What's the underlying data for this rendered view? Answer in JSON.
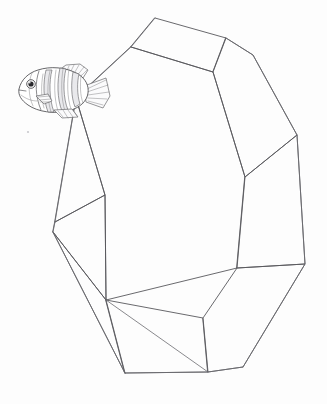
{
  "artwork": {
    "title": "Fish and faceted polyhedron line drawing",
    "medium": "pencil line drawing on white paper",
    "background_color": "#fdfdfd",
    "line_color": "#58585c",
    "canvas": {
      "width": 327,
      "height": 404
    }
  },
  "subjects": {
    "polyhedron": {
      "name": "faceted polyhedron",
      "description": "large irregular multi-faceted solid resembling a cut gem or rock, occupying most of the frame",
      "line_color": "#58585c",
      "fill_color": "#ffffff",
      "face_count": 8,
      "vertices": [
        {
          "id": "v-top-left",
          "x": 155,
          "y": 18
        },
        {
          "id": "v-top-right",
          "x": 226,
          "y": 38
        },
        {
          "id": "v-upper-left",
          "x": 131,
          "y": 47
        },
        {
          "id": "v-upper-mid",
          "x": 213,
          "y": 72
        },
        {
          "id": "v-right-upper",
          "x": 253,
          "y": 55
        },
        {
          "id": "v-right-mid",
          "x": 297,
          "y": 135
        },
        {
          "id": "v-left-shoulder",
          "x": 76,
          "y": 98
        },
        {
          "id": "v-left-mid",
          "x": 105,
          "y": 195
        },
        {
          "id": "v-center-right",
          "x": 245,
          "y": 177
        },
        {
          "id": "v-left-far",
          "x": 55,
          "y": 222
        },
        {
          "id": "v-right-lower",
          "x": 305,
          "y": 264
        },
        {
          "id": "v-left-low",
          "x": 53,
          "y": 232
        },
        {
          "id": "v-mid-low-left",
          "x": 106,
          "y": 300
        },
        {
          "id": "v-mid-low-center",
          "x": 203,
          "y": 318
        },
        {
          "id": "v-right-low",
          "x": 237,
          "y": 268
        },
        {
          "id": "v-bottom-left",
          "x": 125,
          "y": 373
        },
        {
          "id": "v-bottom-mid",
          "x": 208,
          "y": 372
        },
        {
          "id": "v-bottom-right",
          "x": 243,
          "y": 367
        }
      ]
    },
    "fish": {
      "name": "fish",
      "description": "small detailed sketch of a striped fish with large eye, dorsal fin, pectoral fin and fanned tail, facing left",
      "facing": "left",
      "outline_color": "#4a4a4e",
      "band_color": "#e9e9ec",
      "position": {
        "x": 16,
        "y": 62,
        "width": 92,
        "height": 56
      },
      "parts": [
        "head",
        "eye",
        "gill",
        "body-stripes",
        "dorsal-fin",
        "pectoral-fin",
        "anal-fin",
        "tail-fin"
      ]
    },
    "speck": {
      "name": "paper speck",
      "description": "faint grey speck on the paper at lower left of the fish",
      "x": 28,
      "y": 132,
      "color": "#c9c9cd"
    }
  }
}
